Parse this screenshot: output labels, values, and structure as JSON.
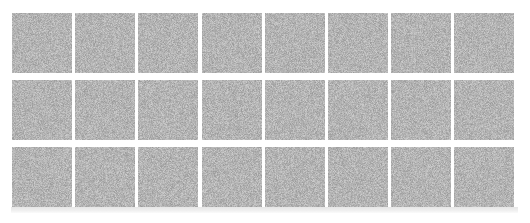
{
  "figure": {
    "kind": "noise-patch-grid",
    "canvas_width": 530,
    "canvas_height": 223,
    "background_color": "#ffffff"
  },
  "grid": {
    "columns": 8,
    "rows": 3,
    "patch_width": 60,
    "patch_height": 60,
    "origin_x": 12,
    "origin_y": 13,
    "column_pitch": 63.2,
    "row_pitch": 67.0,
    "column_gap": 3.2,
    "row_gap": 7.0,
    "patch_count": 24
  },
  "texture": {
    "type": "uniform-grayscale-noise",
    "mean_gray": "#b0b0b0",
    "min_gray": "#8e8e8e",
    "max_gray": "#dcdcdc",
    "grain_size_px": 1
  },
  "baseline_band": {
    "visible": true,
    "x": 11,
    "y": 207,
    "width": 507,
    "height": 6,
    "color": "#ededed"
  },
  "patches": [
    {
      "id": "patch-r1-c1",
      "row": 1,
      "col": 1,
      "seed": 101
    },
    {
      "id": "patch-r1-c2",
      "row": 1,
      "col": 2,
      "seed": 102
    },
    {
      "id": "patch-r1-c3",
      "row": 1,
      "col": 3,
      "seed": 103
    },
    {
      "id": "patch-r1-c4",
      "row": 1,
      "col": 4,
      "seed": 104
    },
    {
      "id": "patch-r1-c5",
      "row": 1,
      "col": 5,
      "seed": 105
    },
    {
      "id": "patch-r1-c6",
      "row": 1,
      "col": 6,
      "seed": 106
    },
    {
      "id": "patch-r1-c7",
      "row": 1,
      "col": 7,
      "seed": 107
    },
    {
      "id": "patch-r1-c8",
      "row": 1,
      "col": 8,
      "seed": 108
    },
    {
      "id": "patch-r2-c1",
      "row": 2,
      "col": 1,
      "seed": 201
    },
    {
      "id": "patch-r2-c2",
      "row": 2,
      "col": 2,
      "seed": 202
    },
    {
      "id": "patch-r2-c3",
      "row": 2,
      "col": 3,
      "seed": 203
    },
    {
      "id": "patch-r2-c4",
      "row": 2,
      "col": 4,
      "seed": 204
    },
    {
      "id": "patch-r2-c5",
      "row": 2,
      "col": 5,
      "seed": 205
    },
    {
      "id": "patch-r2-c6",
      "row": 2,
      "col": 6,
      "seed": 206
    },
    {
      "id": "patch-r2-c7",
      "row": 2,
      "col": 7,
      "seed": 207
    },
    {
      "id": "patch-r2-c8",
      "row": 2,
      "col": 8,
      "seed": 208
    },
    {
      "id": "patch-r3-c1",
      "row": 3,
      "col": 1,
      "seed": 301
    },
    {
      "id": "patch-r3-c2",
      "row": 3,
      "col": 2,
      "seed": 302
    },
    {
      "id": "patch-r3-c3",
      "row": 3,
      "col": 3,
      "seed": 303
    },
    {
      "id": "patch-r3-c4",
      "row": 3,
      "col": 4,
      "seed": 304
    },
    {
      "id": "patch-r3-c5",
      "row": 3,
      "col": 5,
      "seed": 305
    },
    {
      "id": "patch-r3-c6",
      "row": 3,
      "col": 6,
      "seed": 306
    },
    {
      "id": "patch-r3-c7",
      "row": 3,
      "col": 7,
      "seed": 307
    },
    {
      "id": "patch-r3-c8",
      "row": 3,
      "col": 8,
      "seed": 308
    }
  ]
}
